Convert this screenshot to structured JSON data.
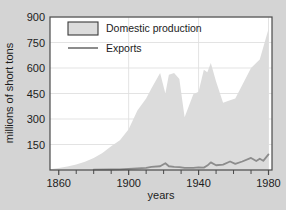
{
  "chart_data": {
    "type": "area",
    "title": "",
    "xlabel": "years",
    "ylabel": "millions of short tons",
    "xlim": [
      1855,
      1982
    ],
    "ylim": [
      0,
      900
    ],
    "grid": true,
    "legend_position": "top-left-inside",
    "xticks": [
      1860,
      1900,
      1940,
      1980
    ],
    "xtick_labels": [
      "1860",
      "1900",
      "1940",
      "1980"
    ],
    "xminor_step": 10,
    "yticks": [
      150,
      300,
      450,
      600,
      750,
      900
    ],
    "ytick_labels": [
      "150",
      "300",
      "450",
      "600",
      "750",
      "900"
    ],
    "series": [
      {
        "name": "Domestic production",
        "style": "area",
        "color": "#dcdcdc",
        "x": [
          1855,
          1860,
          1865,
          1870,
          1875,
          1880,
          1885,
          1890,
          1895,
          1900,
          1905,
          1910,
          1913,
          1918,
          1921,
          1923,
          1926,
          1929,
          1932,
          1937,
          1940,
          1943,
          1945,
          1947,
          1950,
          1954,
          1958,
          1961,
          1965,
          1970,
          1975,
          1980
        ],
        "values": [
          5,
          12,
          20,
          33,
          48,
          70,
          100,
          140,
          175,
          240,
          350,
          420,
          480,
          570,
          450,
          560,
          570,
          535,
          310,
          445,
          460,
          590,
          575,
          630,
          520,
          395,
          410,
          420,
          500,
          600,
          650,
          830
        ]
      },
      {
        "name": "Exports",
        "style": "line",
        "color": "#8c8c8c",
        "x": [
          1880,
          1890,
          1895,
          1900,
          1905,
          1910,
          1913,
          1918,
          1921,
          1923,
          1926,
          1929,
          1932,
          1937,
          1940,
          1943,
          1945,
          1947,
          1950,
          1954,
          1958,
          1961,
          1965,
          1970,
          1973,
          1975,
          1977,
          1980
        ],
        "values": [
          2,
          3,
          4,
          7,
          10,
          13,
          18,
          22,
          40,
          22,
          18,
          17,
          12,
          13,
          15,
          14,
          26,
          45,
          28,
          32,
          50,
          36,
          50,
          71,
          53,
          66,
          54,
          92
        ]
      }
    ]
  },
  "legend": {
    "items": [
      {
        "label": "Domestic production",
        "swatch": "filled-box"
      },
      {
        "label": "Exports",
        "swatch": "line-segment"
      }
    ]
  },
  "colors": {
    "background": "#d4d4d4",
    "plot_background": "#ffffff",
    "area_fill": "#dcdcdc",
    "line": "#8c8c8c",
    "axis": "#4a4a4a",
    "grid": "#e0e0e0",
    "text": "#1c1c1c"
  }
}
